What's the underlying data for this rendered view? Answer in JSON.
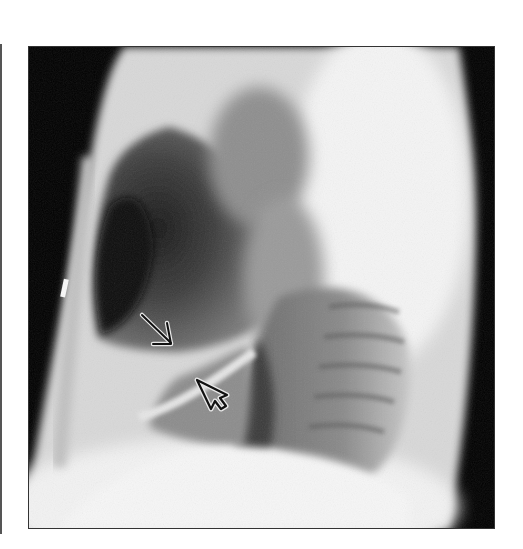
{
  "figure": {
    "type": "lateral chest radiograph",
    "colors": {
      "background": "#ffffff",
      "frame_border": "#333333",
      "air": "#000000",
      "soft_tissue": "#dcdcdc",
      "lung": "#4a4a4a",
      "arrow_stroke": "#111111",
      "arrow_halo": "#e0e0e0"
    },
    "annotations": [
      {
        "id": "line-arrow",
        "style": "thin line arrow",
        "direction": "down-right",
        "tip": [
          172,
          345
        ]
      },
      {
        "id": "open-arrowhead",
        "style": "outlined open arrowhead",
        "direction": "up-left",
        "tip": [
          197,
          380
        ]
      }
    ],
    "marker": {
      "id": "skin-marker",
      "position": [
        64,
        290
      ]
    }
  }
}
